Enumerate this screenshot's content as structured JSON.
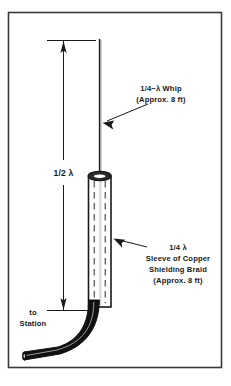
{
  "figure": {
    "kind": "technical-line-drawing",
    "frame": {
      "border_color": "#3a3a3a",
      "background_color": "#ffffff"
    },
    "colors": {
      "line": "#1a1a1a",
      "cable_fill": "#111111",
      "sleeve_fill": "#ffffff",
      "sleeve_shade": "#c9c9c9",
      "text": "#1a1a1a",
      "caption": "#b8b8b8"
    }
  },
  "annotations": {
    "whip": {
      "line1": "1/4−λ Whip",
      "line2": "(Approx. 8 ft)"
    },
    "sleeve": {
      "line1": "1/4 λ",
      "line2": "Sleeve of Copper",
      "line3": "Shielding Braid",
      "line4": "(Approx. 8 ft)"
    },
    "feed": {
      "line1": "to",
      "line2": "Station"
    },
    "dimension": {
      "label": "1/2 λ"
    }
  },
  "caption": {
    "text": ""
  }
}
